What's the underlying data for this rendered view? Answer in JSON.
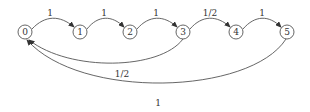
{
  "diagram": {
    "type": "state-transition-graph",
    "nodes": [
      {
        "id": "0",
        "label": "0"
      },
      {
        "id": "1",
        "label": "1"
      },
      {
        "id": "2",
        "label": "2"
      },
      {
        "id": "3",
        "label": "3"
      },
      {
        "id": "4",
        "label": "4"
      },
      {
        "id": "5",
        "label": "5"
      }
    ],
    "edges": [
      {
        "from": "0",
        "to": "1",
        "label": "1"
      },
      {
        "from": "1",
        "to": "2",
        "label": "1"
      },
      {
        "from": "2",
        "to": "3",
        "label": "1"
      },
      {
        "from": "3",
        "to": "4",
        "label": "1/2"
      },
      {
        "from": "4",
        "to": "5",
        "label": "1"
      },
      {
        "from": "3",
        "to": "0",
        "label": "1/2"
      },
      {
        "from": "5",
        "to": "0",
        "label": "1"
      }
    ]
  }
}
